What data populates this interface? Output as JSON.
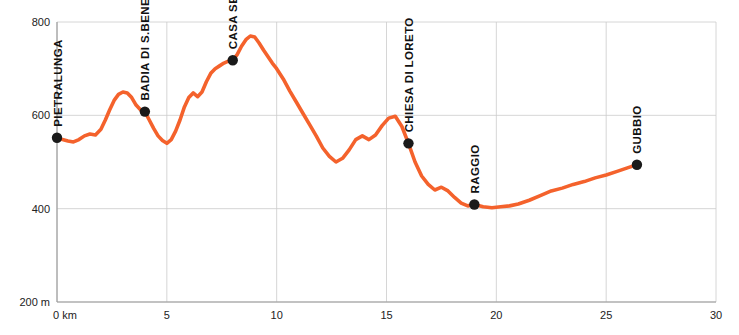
{
  "chart_data": {
    "type": "line",
    "title": "",
    "subtitle": "",
    "xlabel": "",
    "ylabel": "",
    "xlim": [
      0,
      30
    ],
    "ylim": [
      200,
      800
    ],
    "grid": true,
    "legend": "none",
    "line_color": "#F4622C",
    "marker_color": "#1A1A1A",
    "axis_color": "#999999",
    "grid_color": "#CCCCCC",
    "x_ticks": [
      {
        "value": 0,
        "label": "0 km"
      },
      {
        "value": 5,
        "label": "5"
      },
      {
        "value": 10,
        "label": "10"
      },
      {
        "value": 15,
        "label": "15"
      },
      {
        "value": 20,
        "label": "20"
      },
      {
        "value": 25,
        "label": "25"
      },
      {
        "value": 30,
        "label": "30"
      }
    ],
    "y_ticks": [
      {
        "value": 200,
        "label": "200 m"
      },
      {
        "value": 400,
        "label": "400"
      },
      {
        "value": 600,
        "label": "600"
      },
      {
        "value": 800,
        "label": "800"
      }
    ],
    "points_of_interest": [
      {
        "name": "PIETRALUNGA",
        "x": 0.0,
        "y": 552
      },
      {
        "name": "BADIA DI S.BENEDETTO",
        "x": 4.0,
        "y": 608
      },
      {
        "name": "CASA SESSE",
        "x": 8.0,
        "y": 718
      },
      {
        "name": "CHIESA DI LORETO",
        "x": 16.0,
        "y": 540
      },
      {
        "name": "RAGGIO",
        "x": 19.0,
        "y": 409
      },
      {
        "name": "GUBBIO",
        "x": 26.4,
        "y": 494
      }
    ],
    "x": [
      0.0,
      0.25,
      0.5,
      0.75,
      1.0,
      1.25,
      1.5,
      1.75,
      2.0,
      2.2,
      2.4,
      2.6,
      2.8,
      3.0,
      3.2,
      3.4,
      3.6,
      3.8,
      4.0,
      4.2,
      4.4,
      4.6,
      4.8,
      5.0,
      5.2,
      5.4,
      5.6,
      5.8,
      6.0,
      6.2,
      6.4,
      6.6,
      6.8,
      7.0,
      7.2,
      7.4,
      7.6,
      7.8,
      8.0,
      8.2,
      8.4,
      8.6,
      8.8,
      9.0,
      9.2,
      9.4,
      9.6,
      9.8,
      10.0,
      10.3,
      10.6,
      10.9,
      11.2,
      11.5,
      11.8,
      12.1,
      12.4,
      12.7,
      13.0,
      13.3,
      13.6,
      13.9,
      14.2,
      14.5,
      14.8,
      15.1,
      15.4,
      15.7,
      16.0,
      16.3,
      16.6,
      16.9,
      17.2,
      17.5,
      17.8,
      18.1,
      18.4,
      18.7,
      19.0,
      19.4,
      19.8,
      20.2,
      20.6,
      21.0,
      21.5,
      22.0,
      22.5,
      23.0,
      23.5,
      24.0,
      24.5,
      25.0,
      25.5,
      26.0,
      26.4
    ],
    "y": [
      552,
      548,
      545,
      543,
      548,
      556,
      560,
      558,
      570,
      590,
      612,
      632,
      645,
      650,
      648,
      638,
      622,
      612,
      608,
      590,
      572,
      556,
      546,
      540,
      548,
      566,
      590,
      618,
      638,
      648,
      640,
      650,
      672,
      690,
      700,
      706,
      712,
      716,
      718,
      730,
      748,
      762,
      770,
      768,
      755,
      740,
      726,
      712,
      700,
      678,
      652,
      628,
      604,
      580,
      556,
      530,
      512,
      500,
      508,
      526,
      548,
      556,
      548,
      558,
      578,
      594,
      598,
      576,
      540,
      500,
      470,
      452,
      440,
      446,
      438,
      424,
      412,
      406,
      409,
      404,
      402,
      404,
      406,
      410,
      418,
      428,
      438,
      444,
      452,
      458,
      466,
      472,
      480,
      488,
      494
    ]
  }
}
